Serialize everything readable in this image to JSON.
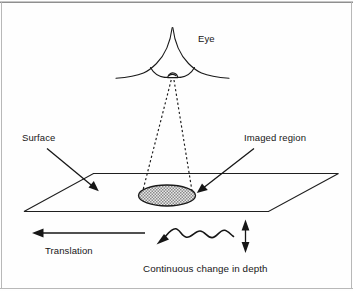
{
  "figure": {
    "type": "diagram",
    "labels": {
      "eye": "Eye",
      "surface": "Surface",
      "imaged_region": "Imaged region",
      "translation": "Translation",
      "depth_caption": "Continuous change in depth"
    },
    "colors": {
      "ink": "#161616",
      "stroke": "#1a1a1a",
      "frame": "#b8b8b8",
      "page": "#fefefe",
      "ellipse_fill": "#d9d9d9"
    },
    "elements": {
      "eye_icon": "eye-cone-icon",
      "pupil_icon": "pupil-icon",
      "projection_icon": "dashed-projection-cone-icon",
      "surface_icon": "surface-plane-icon",
      "imaged_region_icon": "stippled-ellipse-icon",
      "translation_arrow_icon": "left-arrow-icon",
      "wave_icon": "wavy-depth-arrow-icon",
      "depth_arrow_icon": "vertical-double-arrow-icon",
      "surface_pointer_icon": "leader-arrow-icon",
      "imaged_region_pointer_icon": "leader-arrow-icon"
    }
  }
}
